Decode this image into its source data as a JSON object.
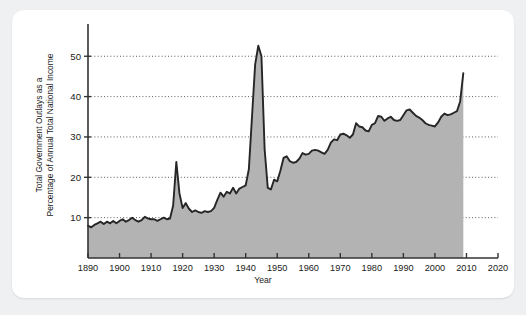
{
  "figure": {
    "background": "#eef0f1",
    "card_background": "#ffffff"
  },
  "chart_data": {
    "type": "area",
    "title": "",
    "xlabel": "Year",
    "ylabel_line1": "Total Government Outlays as a",
    "ylabel_line2": "Percentage of Annual Total National Income",
    "xlim": [
      1890,
      2020
    ],
    "ylim": [
      0,
      57
    ],
    "xticks": [
      1890,
      1900,
      1910,
      1920,
      1930,
      1940,
      1950,
      1960,
      1970,
      1980,
      1990,
      2000,
      2010,
      2020
    ],
    "xticklabels": [
      "1890",
      "1900",
      "1910",
      "1920",
      "1930",
      "1940",
      "1950",
      "1960",
      "1970",
      "1980",
      "1990",
      "2000",
      "2010",
      "2020"
    ],
    "yticks": [
      10,
      20,
      30,
      40,
      50
    ],
    "yticklabels": [
      "10",
      "20",
      "30",
      "40",
      "50"
    ],
    "grid": "dotted-horizontal",
    "legend": "none",
    "line_color": "#262626",
    "fill_color": "#b3b3b3",
    "series": [
      {
        "name": "Total Government Outlays as a Percentage of Annual Total National Income",
        "x": [
          1890,
          1891,
          1892,
          1893,
          1894,
          1895,
          1896,
          1897,
          1898,
          1899,
          1900,
          1901,
          1902,
          1903,
          1904,
          1905,
          1906,
          1907,
          1908,
          1909,
          1910,
          1911,
          1912,
          1913,
          1914,
          1915,
          1916,
          1917,
          1918,
          1919,
          1920,
          1921,
          1922,
          1923,
          1924,
          1925,
          1926,
          1927,
          1928,
          1929,
          1930,
          1931,
          1932,
          1933,
          1934,
          1935,
          1936,
          1937,
          1938,
          1939,
          1940,
          1941,
          1942,
          1943,
          1944,
          1945,
          1946,
          1947,
          1948,
          1949,
          1950,
          1951,
          1952,
          1953,
          1954,
          1955,
          1956,
          1957,
          1958,
          1959,
          1960,
          1961,
          1962,
          1963,
          1964,
          1965,
          1966,
          1967,
          1968,
          1969,
          1970,
          1971,
          1972,
          1973,
          1974,
          1975,
          1976,
          1977,
          1978,
          1979,
          1980,
          1981,
          1982,
          1983,
          1984,
          1985,
          1986,
          1987,
          1988,
          1989,
          1990,
          1991,
          1992,
          1993,
          1994,
          1995,
          1996,
          1997,
          1998,
          1999,
          2000,
          2001,
          2002,
          2003,
          2004,
          2005,
          2006,
          2007,
          2008,
          2009
        ],
        "y": [
          8.0,
          7.6,
          8.2,
          8.6,
          9.0,
          8.4,
          9.0,
          8.6,
          9.2,
          8.6,
          9.2,
          9.6,
          9.0,
          9.4,
          10.0,
          9.4,
          9.0,
          9.4,
          10.2,
          9.8,
          9.6,
          9.6,
          9.2,
          9.6,
          10.0,
          9.6,
          9.8,
          13.0,
          23.8,
          16.0,
          12.4,
          13.6,
          12.2,
          11.4,
          11.8,
          11.4,
          11.2,
          11.6,
          11.4,
          11.6,
          12.4,
          14.4,
          16.2,
          15.2,
          16.4,
          16.0,
          17.4,
          16.0,
          17.2,
          17.6,
          18.0,
          22.0,
          35.0,
          48.0,
          52.6,
          50.0,
          27.0,
          17.4,
          17.0,
          19.4,
          19.0,
          21.6,
          24.8,
          25.2,
          24.0,
          23.6,
          23.8,
          24.6,
          26.0,
          25.6,
          25.8,
          26.6,
          26.8,
          26.6,
          26.2,
          25.8,
          26.8,
          28.6,
          29.4,
          29.2,
          30.6,
          30.8,
          30.4,
          29.8,
          30.6,
          33.4,
          32.6,
          32.4,
          31.6,
          31.4,
          33.0,
          33.4,
          35.2,
          35.0,
          34.0,
          34.6,
          35.0,
          34.2,
          34.0,
          34.2,
          35.4,
          36.6,
          36.8,
          36.0,
          35.2,
          34.8,
          34.2,
          33.4,
          33.0,
          32.8,
          32.6,
          33.6,
          35.0,
          35.8,
          35.4,
          35.6,
          36.0,
          36.4,
          38.8,
          45.8
        ]
      }
    ]
  }
}
